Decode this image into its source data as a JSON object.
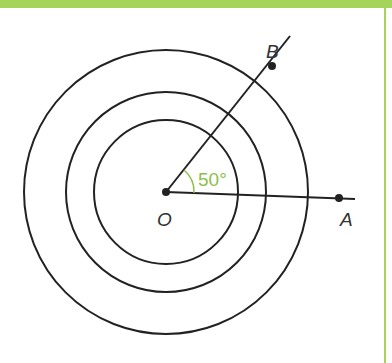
{
  "figure": {
    "center_label": "O",
    "point_a_label": "A",
    "point_b_label": "B",
    "angle_label": "50°",
    "angle_degrees": 50,
    "circles": [
      {
        "name": "inner",
        "radius": 72
      },
      {
        "name": "middle",
        "radius": 100
      },
      {
        "name": "outer",
        "radius": 142
      }
    ],
    "colors": {
      "accent": "#a6d45a",
      "angle": "#8cbf4a",
      "stroke": "#222222"
    }
  }
}
